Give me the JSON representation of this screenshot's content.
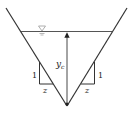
{
  "diagram": {
    "labels": {
      "depth": "y",
      "depth_subscript": "c",
      "left_rise": "1",
      "left_run": "z",
      "right_rise": "1",
      "right_run": "z",
      "water_surface_symbol": "∇"
    },
    "colors": {
      "line": "#333333",
      "surface": "#555555",
      "symbol": "#9a9a9a",
      "background": "#ffffff"
    }
  }
}
